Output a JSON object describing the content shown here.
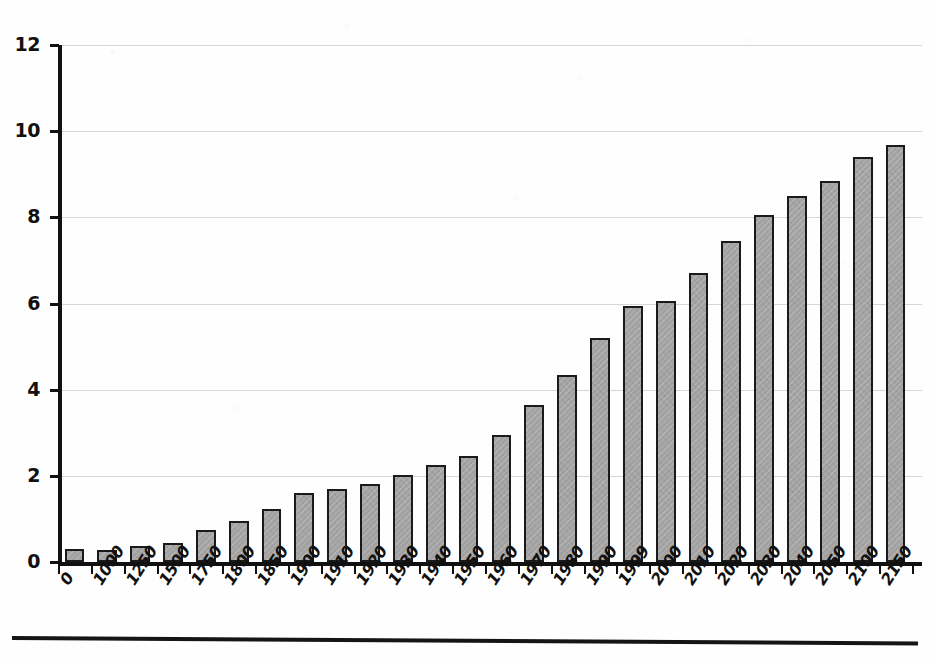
{
  "chart_data": {
    "type": "bar",
    "title": "",
    "subtitle": "",
    "xlabel": "",
    "ylabel": "",
    "categories": [
      "0",
      "1000",
      "1250",
      "1500",
      "1750",
      "1800",
      "1850",
      "1900",
      "1910",
      "1920",
      "1930",
      "1940",
      "1950",
      "1960",
      "1970",
      "1980",
      "1990",
      "1999",
      "2000",
      "2010",
      "2020",
      "2030",
      "2040",
      "2050",
      "2100",
      "2150"
    ],
    "values": [
      0.3,
      0.28,
      0.37,
      0.45,
      0.75,
      0.95,
      1.22,
      1.6,
      1.7,
      1.8,
      2.02,
      2.25,
      2.45,
      2.95,
      3.65,
      4.35,
      5.2,
      5.95,
      6.05,
      6.7,
      7.45,
      8.05,
      8.5,
      8.85,
      9.4,
      9.67
    ],
    "y_ticks": [
      "0",
      "2",
      "4",
      "6",
      "8",
      "10",
      "12"
    ],
    "y_tick_values": [
      0,
      2,
      4,
      6,
      8,
      10,
      12
    ],
    "ylim": [
      0,
      12
    ],
    "grid": true,
    "legend": "none",
    "bar_color": "#a3a3a3",
    "bar_edge_color": "#1a1a1a",
    "gridline_color": "#d6d6d6",
    "axis_color": "#111111",
    "background_color": "#fefefe"
  }
}
